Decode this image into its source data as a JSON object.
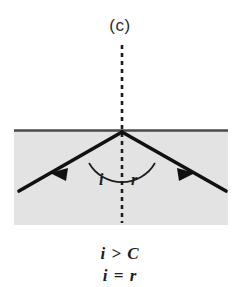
{
  "figure": {
    "panel_label": "(c)",
    "domain_type": "physics-optics-diagram",
    "description_name": "total-internal-reflection-diagram"
  },
  "diagram": {
    "medium": {
      "name": "denser-medium-region",
      "fill_color": "#e3e3e3"
    },
    "interface": {
      "name": "medium-boundary-line",
      "color": "#4a4a4a"
    },
    "normal": {
      "name": "normal-dashed-line",
      "color": "#1c1c1c",
      "style": "dashed"
    },
    "incident_ray": {
      "name": "incident-ray",
      "color": "#111111",
      "arrow_direction": "down-left"
    },
    "reflected_ray": {
      "name": "reflected-ray",
      "color": "#111111",
      "arrow_direction": "down-right"
    },
    "arcs": {
      "name": "angle-arc",
      "color": "#1c1c1c"
    },
    "angle_labels": {
      "incidence": "i",
      "reflection": "r"
    }
  },
  "caption": {
    "lines": [
      "i > C",
      "i = r"
    ],
    "line_1": "i > C",
    "line_2": "i = r"
  }
}
